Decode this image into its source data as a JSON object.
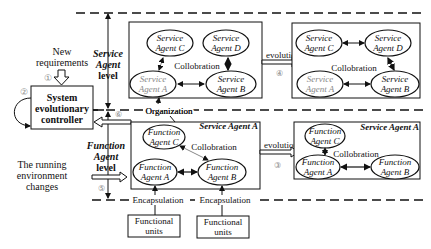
{
  "controller": {
    "line1": "System",
    "line2": "evolutionary",
    "line3": "controller"
  },
  "inputs": {
    "new_requirements": [
      "New",
      "requirements"
    ],
    "running_env": [
      "The running",
      "environment",
      "changes"
    ]
  },
  "levels": {
    "service": [
      "Service",
      "Agent",
      "level"
    ],
    "function": [
      "Function",
      "Agent",
      "level"
    ]
  },
  "step_labels": {
    "s1": "①",
    "s2": "②",
    "s3": "③",
    "s4": "④",
    "s5": "⑤",
    "s6": "⑥"
  },
  "service_before": {
    "agents": [
      {
        "id": "C",
        "l1": "Service",
        "l2": "Agent C"
      },
      {
        "id": "D",
        "l1": "Service",
        "l2": "Agent D"
      },
      {
        "id": "A",
        "l1": "Service",
        "l2": "Agent A"
      },
      {
        "id": "B",
        "l1": "Service",
        "l2": "Agent B"
      }
    ],
    "collab": "Collobration"
  },
  "service_after": {
    "agents": [
      {
        "id": "C",
        "l1": "Service",
        "l2": "Agent C"
      },
      {
        "id": "D",
        "l1": "Service",
        "l2": "Agent D"
      },
      {
        "id": "A",
        "l1": "Service",
        "l2": "Agent A"
      },
      {
        "id": "B",
        "l1": "Service",
        "l2": "Agent B"
      }
    ],
    "collab": "Collobration"
  },
  "function_before": {
    "title": "Service Agent A",
    "agents": [
      {
        "id": "C",
        "l1": "Function",
        "l2": "Agent C"
      },
      {
        "id": "A",
        "l1": "Function",
        "l2": "Agent A"
      },
      {
        "id": "B",
        "l1": "Function",
        "l2": "Agent B"
      }
    ],
    "collab": "Collobration"
  },
  "function_after": {
    "title": "Service Agent A",
    "agents": [
      {
        "id": "C",
        "l1": "Function",
        "l2": "Agent C"
      },
      {
        "id": "A",
        "l1": "Function",
        "l2": "Agent A"
      },
      {
        "id": "B",
        "l1": "Function",
        "l2": "Agent B"
      }
    ],
    "collab": "Collobration"
  },
  "labels": {
    "evolution": "evolution",
    "organization": "Organization",
    "encapsulation": "Encapsulation"
  },
  "units": [
    {
      "l1": "Functional",
      "l2": "units"
    },
    {
      "l1": "Functional",
      "l2": "units"
    }
  ]
}
